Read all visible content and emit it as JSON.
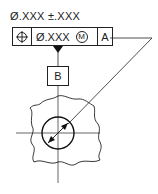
{
  "dimension": {
    "text": "Ø.XXX ±.XXX"
  },
  "feature_control_frame": {
    "symbol": "position-symbol",
    "tolerance": "Ø.XXX",
    "modifier": "M",
    "datum": "A"
  },
  "datum_feature": {
    "label": "B"
  },
  "colors": {
    "line": "#222222",
    "background": "#ffffff"
  }
}
